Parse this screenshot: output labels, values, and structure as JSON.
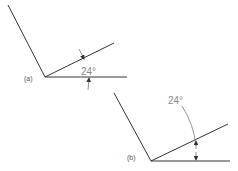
{
  "diagrams": [
    {
      "label": "(a)",
      "angle_text": "24°"
    },
    {
      "label": "(b)",
      "angle_text": "24°"
    }
  ],
  "colors": {
    "line": "#333333",
    "dimension": "#777777",
    "text": "#888888"
  }
}
